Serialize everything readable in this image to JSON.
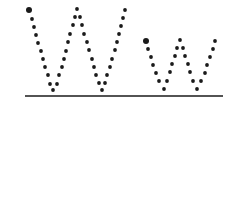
{
  "worksheet": {
    "description": "Dotted letter tracing: uppercase W and lowercase w",
    "letters": [
      {
        "char": "W",
        "case": "upper",
        "start_dot": [
          29,
          10
        ],
        "dots": [
          [
            32,
            19
          ],
          [
            34,
            27
          ],
          [
            36,
            35
          ],
          [
            38,
            43
          ],
          [
            41,
            51
          ],
          [
            43,
            59
          ],
          [
            45,
            67
          ],
          [
            48,
            75
          ],
          [
            50,
            84
          ],
          [
            53,
            90
          ],
          [
            57,
            84
          ],
          [
            59,
            75
          ],
          [
            62,
            67
          ],
          [
            64,
            59
          ],
          [
            66,
            51
          ],
          [
            68,
            42
          ],
          [
            70,
            34
          ],
          [
            73,
            25
          ],
          [
            75,
            17
          ],
          [
            77,
            9
          ],
          [
            80,
            17
          ],
          [
            82,
            25
          ],
          [
            84,
            34
          ],
          [
            87,
            42
          ],
          [
            89,
            50
          ],
          [
            92,
            59
          ],
          [
            94,
            67
          ],
          [
            96,
            75
          ],
          [
            99,
            83
          ],
          [
            102,
            90
          ],
          [
            105,
            83
          ],
          [
            107,
            75
          ],
          [
            110,
            67
          ],
          [
            112,
            59
          ],
          [
            115,
            50
          ],
          [
            117,
            42
          ],
          [
            119,
            34
          ],
          [
            121,
            26
          ],
          [
            123,
            18
          ],
          [
            125,
            10
          ]
        ]
      },
      {
        "char": "w",
        "case": "lower",
        "start_dot": [
          146,
          41
        ],
        "dots": [
          [
            148,
            49
          ],
          [
            151,
            57
          ],
          [
            153,
            65
          ],
          [
            156,
            73
          ],
          [
            159,
            81
          ],
          [
            164,
            89
          ],
          [
            167,
            81
          ],
          [
            170,
            72
          ],
          [
            172,
            64
          ],
          [
            175,
            56
          ],
          [
            177,
            48
          ],
          [
            180,
            40
          ],
          [
            183,
            48
          ],
          [
            185,
            56
          ],
          [
            188,
            64
          ],
          [
            190,
            72
          ],
          [
            193,
            81
          ],
          [
            197,
            89
          ],
          [
            201,
            81
          ],
          [
            205,
            73
          ],
          [
            207,
            65
          ],
          [
            210,
            57
          ],
          [
            213,
            49
          ],
          [
            215,
            41
          ]
        ]
      }
    ],
    "baseline": {
      "x1": 25,
      "x2": 223,
      "y": 96
    },
    "colors": {
      "dot": "#1a1a1a",
      "line": "#1a1a1a",
      "background": "#ffffff"
    }
  }
}
